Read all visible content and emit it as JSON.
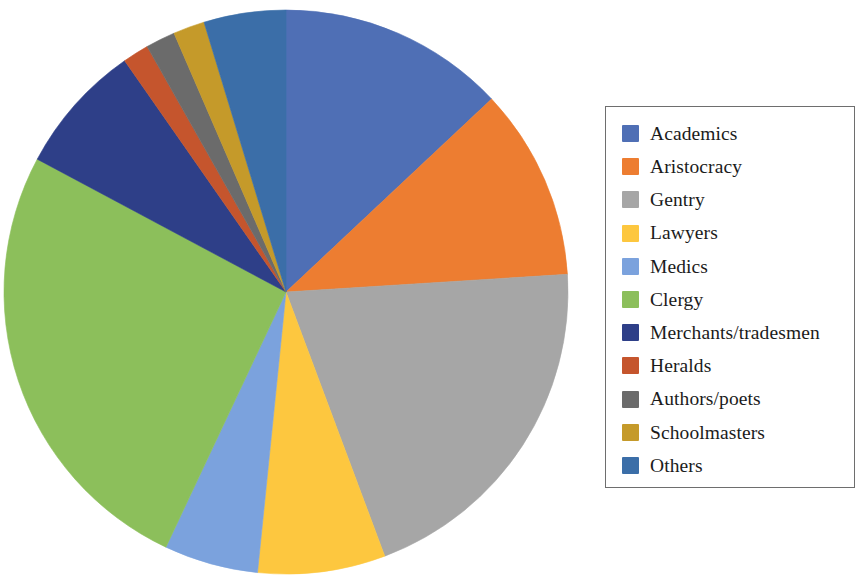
{
  "chart_data": {
    "type": "pie",
    "title": "",
    "subtitle": "",
    "xlabel": "",
    "ylabel": "",
    "legend_position": "right",
    "grid": false,
    "start_angle_deg": 0,
    "direction": "clockwise",
    "categories": [
      "Academics",
      "Aristocracy",
      "Gentry",
      "Lawyers",
      "Medics",
      "Clergy",
      "Merchants/tradesmen",
      "Heralds",
      "Authors/poets",
      "Schoolmasters",
      "Others"
    ],
    "values": [
      13.0,
      11.0,
      20.3,
      7.3,
      5.4,
      25.8,
      7.5,
      1.5,
      1.7,
      1.8,
      4.7
    ],
    "colors": [
      "#4f6fb5",
      "#ed7d31",
      "#a6a6a6",
      "#fdc73f",
      "#7ba2dd",
      "#8cbf5b",
      "#2e3f88",
      "#c5552d",
      "#6b6b6b",
      "#c59a2a",
      "#3b6ea8"
    ],
    "slices": [
      {
        "label": "Academics",
        "value": 13.0,
        "color": "#4f6fb5",
        "start_deg": 0.0,
        "end_deg": 46.8
      },
      {
        "label": "Aristocracy",
        "value": 11.0,
        "color": "#ed7d31",
        "start_deg": 46.8,
        "end_deg": 86.4
      },
      {
        "label": "Gentry",
        "value": 20.3,
        "color": "#a6a6a6",
        "start_deg": 86.4,
        "end_deg": 159.5
      },
      {
        "label": "Lawyers",
        "value": 7.3,
        "color": "#fdc73f",
        "start_deg": 159.5,
        "end_deg": 185.8
      },
      {
        "label": "Medics",
        "value": 5.4,
        "color": "#7ba2dd",
        "start_deg": 185.8,
        "end_deg": 205.2
      },
      {
        "label": "Clergy",
        "value": 25.8,
        "color": "#8cbf5b",
        "start_deg": 205.2,
        "end_deg": 298.1
      },
      {
        "label": "Merchants/tradesmen",
        "value": 7.5,
        "color": "#2e3f88",
        "start_deg": 298.1,
        "end_deg": 325.1
      },
      {
        "label": "Heralds",
        "value": 1.5,
        "color": "#c5552d",
        "start_deg": 325.1,
        "end_deg": 330.5
      },
      {
        "label": "Authors/poets",
        "value": 1.7,
        "color": "#6b6b6b",
        "start_deg": 330.5,
        "end_deg": 336.6
      },
      {
        "label": "Schoolmasters",
        "value": 1.8,
        "color": "#c59a2a",
        "start_deg": 336.6,
        "end_deg": 343.1
      },
      {
        "label": "Others",
        "value": 4.7,
        "color": "#3b6ea8",
        "start_deg": 343.1,
        "end_deg": 360.0
      }
    ],
    "geometry": {
      "center_x": 286,
      "center_y": 292,
      "radius": 282
    }
  },
  "legend": {
    "items": [
      {
        "label": "Academics",
        "color": "#4f6fb5"
      },
      {
        "label": "Aristocracy",
        "color": "#ed7d31"
      },
      {
        "label": "Gentry",
        "color": "#a6a6a6"
      },
      {
        "label": "Lawyers",
        "color": "#fdc73f"
      },
      {
        "label": "Medics",
        "color": "#7ba2dd"
      },
      {
        "label": "Clergy",
        "color": "#8cbf5b"
      },
      {
        "label": "Merchants/tradesmen",
        "color": "#2e3f88"
      },
      {
        "label": "Heralds",
        "color": "#c5552d"
      },
      {
        "label": "Authors/poets",
        "color": "#6b6b6b"
      },
      {
        "label": "Schoolmasters",
        "color": "#c59a2a"
      },
      {
        "label": "Others",
        "color": "#3b6ea8"
      }
    ]
  }
}
